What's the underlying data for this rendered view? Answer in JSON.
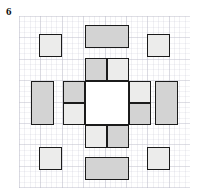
{
  "figure": {
    "label": "6",
    "colors": {
      "page_background": "#ffffff",
      "grid_line": "#aaaab9",
      "shape_outline": "#1b1b1b",
      "tone_dark": "#d3d3d3",
      "tone_light": "#ececeb",
      "tone_white": "#ffffff"
    },
    "grid": {
      "left": 19,
      "top": 16,
      "width": 171,
      "height": 172,
      "major_cell_px": 21.4,
      "minor_cell_px": 5.35
    },
    "shapes": [
      {
        "name": "corner-square-top-left",
        "x": 39,
        "y": 34,
        "w": 23,
        "h": 23,
        "tone": "tone-light"
      },
      {
        "name": "corner-square-top-right",
        "x": 147,
        "y": 34,
        "w": 23,
        "h": 23,
        "tone": "tone-light"
      },
      {
        "name": "corner-square-bottom-left",
        "x": 39,
        "y": 147,
        "w": 23,
        "h": 23,
        "tone": "tone-light"
      },
      {
        "name": "corner-square-bottom-right",
        "x": 147,
        "y": 147,
        "w": 23,
        "h": 23,
        "tone": "tone-light"
      },
      {
        "name": "outer-bar-top",
        "x": 85,
        "y": 25,
        "w": 44,
        "h": 23,
        "tone": "tone-dark"
      },
      {
        "name": "outer-bar-bottom",
        "x": 85,
        "y": 157,
        "w": 44,
        "h": 23,
        "tone": "tone-dark"
      },
      {
        "name": "outer-bar-left",
        "x": 31,
        "y": 81,
        "w": 23,
        "h": 44,
        "tone": "tone-dark"
      },
      {
        "name": "outer-bar-right",
        "x": 155,
        "y": 81,
        "w": 23,
        "h": 44,
        "tone": "tone-dark"
      },
      {
        "name": "inner-square-top-left",
        "x": 85,
        "y": 58,
        "w": 22,
        "h": 23,
        "tone": "tone-dark"
      },
      {
        "name": "inner-square-top-right",
        "x": 107,
        "y": 58,
        "w": 22,
        "h": 23,
        "tone": "tone-light"
      },
      {
        "name": "inner-square-left-upper",
        "x": 63,
        "y": 81,
        "w": 22,
        "h": 22,
        "tone": "tone-dark"
      },
      {
        "name": "inner-square-left-lower",
        "x": 63,
        "y": 103,
        "w": 22,
        "h": 22,
        "tone": "tone-light"
      },
      {
        "name": "inner-square-right-upper",
        "x": 129,
        "y": 81,
        "w": 22,
        "h": 22,
        "tone": "tone-light"
      },
      {
        "name": "inner-square-right-lower",
        "x": 129,
        "y": 103,
        "w": 22,
        "h": 22,
        "tone": "tone-dark"
      },
      {
        "name": "inner-square-bottom-left",
        "x": 85,
        "y": 125,
        "w": 22,
        "h": 23,
        "tone": "tone-light"
      },
      {
        "name": "inner-square-bottom-right",
        "x": 107,
        "y": 125,
        "w": 22,
        "h": 23,
        "tone": "tone-dark"
      },
      {
        "name": "center-void",
        "x": 85,
        "y": 81,
        "w": 44,
        "h": 44,
        "tone": "tone-white"
      }
    ]
  }
}
